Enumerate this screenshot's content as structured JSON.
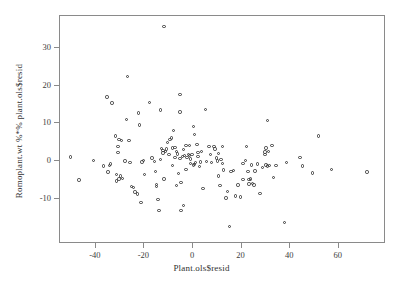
{
  "chart_data": {
    "type": "scatter",
    "title": "",
    "xlabel": "Plant.ols$resid",
    "ylabel": "Romoplant.wt %*% plant.ols$resid",
    "xlim": [
      -53,
      79
    ],
    "ylim": [
      -19,
      37
    ],
    "xticks": [
      -40,
      -20,
      0,
      20,
      40,
      60
    ],
    "yticks": [
      -10,
      0,
      10,
      20,
      30
    ],
    "grid": false,
    "legend": "none",
    "marker": "open-circle",
    "marker_color": "#3a3a3a",
    "n_points": 152,
    "points": [
      [
        -50.0,
        0.8
      ],
      [
        -46.5,
        -5.3
      ],
      [
        -40.5,
        -0.2
      ],
      [
        -36.5,
        -1.6
      ],
      [
        -35.0,
        16.7
      ],
      [
        -34.5,
        -3.2
      ],
      [
        -33.5,
        -1.1
      ],
      [
        -33.0,
        15.1
      ],
      [
        -31.5,
        6.4
      ],
      [
        -31.0,
        -3.9
      ],
      [
        -31.0,
        -5.6
      ],
      [
        -30.5,
        3.6
      ],
      [
        -30.5,
        2.0
      ],
      [
        -30.0,
        5.5
      ],
      [
        -30.0,
        -5.0
      ],
      [
        -29.5,
        -4.2
      ],
      [
        -29.0,
        5.2
      ],
      [
        -28.5,
        -4.9
      ],
      [
        -27.5,
        -0.3
      ],
      [
        -27.0,
        10.7
      ],
      [
        -26.5,
        22.1
      ],
      [
        -26.0,
        5.2
      ],
      [
        -25.5,
        -0.6
      ],
      [
        -25.0,
        -7.0
      ],
      [
        -24.0,
        -7.3
      ],
      [
        -23.5,
        -8.5
      ],
      [
        -22.5,
        -9.0
      ],
      [
        -22.0,
        12.5
      ],
      [
        -21.5,
        9.3
      ],
      [
        -21.0,
        -11.3
      ],
      [
        -20.5,
        -0.5
      ],
      [
        -19.5,
        -3.9
      ],
      [
        -17.5,
        15.3
      ],
      [
        -16.5,
        0.5
      ],
      [
        -15.5,
        -0.4
      ],
      [
        -15.0,
        -3.1
      ],
      [
        -14.5,
        -6.5
      ],
      [
        -14.5,
        -7.0
      ],
      [
        -14.0,
        -10.5
      ],
      [
        -13.5,
        -13.4
      ],
      [
        -13.0,
        13.2
      ],
      [
        -12.5,
        3.0
      ],
      [
        -12.0,
        2.5
      ],
      [
        -12.0,
        1.9
      ],
      [
        -11.5,
        35.4
      ],
      [
        -11.5,
        -5.0
      ],
      [
        -11.0,
        2.2
      ],
      [
        -10.5,
        2.9
      ],
      [
        -10.0,
        4.6
      ],
      [
        -9.5,
        1.4
      ],
      [
        -9.0,
        5.5
      ],
      [
        -8.5,
        5.8
      ],
      [
        -8.0,
        3.2
      ],
      [
        -8.0,
        -1.4
      ],
      [
        -7.5,
        7.8
      ],
      [
        -7.0,
        3.3
      ],
      [
        -7.0,
        0.6
      ],
      [
        -6.5,
        2.2
      ],
      [
        -6.5,
        -6.8
      ],
      [
        -6.0,
        1.6
      ],
      [
        -5.5,
        -3.5
      ],
      [
        -5.0,
        12.7
      ],
      [
        -5.0,
        17.3
      ],
      [
        -4.5,
        -5.9
      ],
      [
        -4.5,
        -13.3
      ],
      [
        -4.0,
        0.9
      ],
      [
        -3.5,
        2.7
      ],
      [
        -3.5,
        -12.0
      ],
      [
        -3.0,
        1.2
      ],
      [
        -2.5,
        3.9
      ],
      [
        -2.5,
        -2.5
      ],
      [
        -2.0,
        0.7
      ],
      [
        -1.5,
        1.4
      ],
      [
        -1.0,
        3.9
      ],
      [
        -1.0,
        1.2
      ],
      [
        -0.5,
        0.3
      ],
      [
        -0.5,
        -1.0
      ],
      [
        0.0,
        1.5
      ],
      [
        0.5,
        -1.3
      ],
      [
        0.5,
        8.8
      ],
      [
        1.0,
        6.7
      ],
      [
        1.0,
        -1.2
      ],
      [
        1.5,
        -0.7
      ],
      [
        2.0,
        4.1
      ],
      [
        2.5,
        1.0
      ],
      [
        3.0,
        -1.7
      ],
      [
        3.5,
        -0.5
      ],
      [
        4.0,
        2.2
      ],
      [
        4.5,
        -7.5
      ],
      [
        5.5,
        13.4
      ],
      [
        6.0,
        -0.4
      ],
      [
        7.0,
        3.6
      ],
      [
        7.5,
        1.5
      ],
      [
        8.0,
        -0.6
      ],
      [
        9.0,
        3.5
      ],
      [
        9.5,
        2.9
      ],
      [
        10.0,
        0.5
      ],
      [
        10.5,
        -0.3
      ],
      [
        11.0,
        -4.2
      ],
      [
        11.0,
        1.8
      ],
      [
        11.5,
        -6.7
      ],
      [
        12.0,
        0.1
      ],
      [
        12.5,
        -1.0
      ],
      [
        13.0,
        -2.7
      ],
      [
        14.0,
        -10.1
      ],
      [
        14.5,
        -8.4
      ],
      [
        15.5,
        -17.6
      ],
      [
        16.0,
        -3.0
      ],
      [
        17.0,
        -2.8
      ],
      [
        18.0,
        -9.5
      ],
      [
        19.0,
        -6.6
      ],
      [
        20.0,
        -9.8
      ],
      [
        21.0,
        -5.2
      ],
      [
        22.0,
        -0.1
      ],
      [
        22.5,
        3.5
      ],
      [
        23.0,
        -3.0
      ],
      [
        23.5,
        -5.1
      ],
      [
        23.5,
        -6.4
      ],
      [
        24.0,
        -5.0
      ],
      [
        24.5,
        -1.3
      ],
      [
        25.0,
        -6.2
      ],
      [
        26.0,
        -2.9
      ],
      [
        27.0,
        -1.1
      ],
      [
        28.0,
        -8.9
      ],
      [
        29.0,
        -2.0
      ],
      [
        30.0,
        1.5
      ],
      [
        30.5,
        -1.3
      ],
      [
        30.5,
        3.2
      ],
      [
        31.0,
        10.5
      ],
      [
        31.0,
        -1.6
      ],
      [
        31.5,
        2.3
      ],
      [
        32.0,
        -1.4
      ],
      [
        33.0,
        3.8
      ],
      [
        33.5,
        -4.7
      ],
      [
        34.5,
        -1.5
      ],
      [
        38.0,
        -16.6
      ],
      [
        39.0,
        -0.6
      ],
      [
        44.5,
        0.7
      ],
      [
        45.5,
        -1.6
      ],
      [
        49.5,
        -3.4
      ],
      [
        52.0,
        6.4
      ],
      [
        57.5,
        -2.5
      ],
      [
        72.0,
        -3.2
      ],
      [
        -34.0,
        -1.5
      ],
      [
        -20.0,
        -0.2
      ],
      [
        -13.0,
        0.2
      ],
      [
        -5.0,
        0.4
      ],
      [
        2.5,
        2.0
      ],
      [
        12.5,
        3.5
      ],
      [
        21.0,
        -1.0
      ],
      [
        25.5,
        -6.6
      ],
      [
        30.0,
        2.1
      ]
    ]
  },
  "axes": {
    "x_tick_labels": [
      "-40",
      "-20",
      "0",
      "20",
      "40",
      "60"
    ],
    "y_tick_labels": [
      "30",
      "20",
      "10",
      "0",
      "-10"
    ],
    "x_title": "Plant.ols$resid",
    "y_title": "Romoplant.wt %*% plant.ols$resid"
  }
}
